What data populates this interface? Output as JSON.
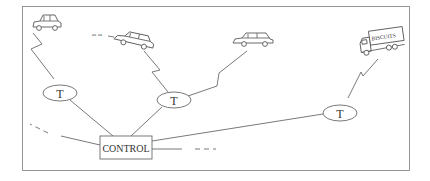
{
  "diagram": {
    "type": "network-diagram",
    "control": {
      "label": "CONTROL"
    },
    "transceivers": [
      {
        "id": "t1",
        "label": "T"
      },
      {
        "id": "t2",
        "label": "T"
      },
      {
        "id": "t3",
        "label": "T"
      }
    ],
    "vehicles": [
      {
        "id": "car-1",
        "kind": "car"
      },
      {
        "id": "car-2",
        "kind": "car",
        "note": "moving (exhaust marks)"
      },
      {
        "id": "car-3",
        "kind": "car"
      },
      {
        "id": "truck-1",
        "kind": "truck",
        "label": "BISCUITS"
      }
    ],
    "exhaust_text": "oe oe",
    "links": [
      {
        "from": "car-1",
        "to": "t1",
        "kind": "radio"
      },
      {
        "from": "car-2",
        "to": "t2",
        "kind": "radio"
      },
      {
        "from": "car-3",
        "to": "t2",
        "kind": "radio"
      },
      {
        "from": "truck-1",
        "to": "t3",
        "kind": "radio"
      },
      {
        "from": "t1",
        "to": "control",
        "kind": "wire"
      },
      {
        "from": "t2",
        "to": "control",
        "kind": "wire"
      },
      {
        "from": "t3",
        "to": "control",
        "kind": "wire"
      },
      {
        "from": "control",
        "to": "offscreen-left",
        "kind": "wire-dashed"
      },
      {
        "from": "control",
        "to": "offscreen-right",
        "kind": "wire-dashed"
      }
    ],
    "colors": {
      "line": "#6a6a6a",
      "frame": "#8a8a8a",
      "background": "#ffffff"
    }
  }
}
